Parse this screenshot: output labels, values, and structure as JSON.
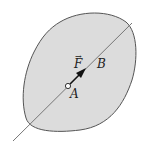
{
  "diagram": {
    "type": "rigid-body-force",
    "body": {
      "fill": "#dcdcdc",
      "stroke": "#555555"
    },
    "line_of_action": {
      "color": "#777777"
    },
    "labels": {
      "force": "F",
      "force_vector_mark": "→",
      "point_a": "A",
      "point_b": "B"
    },
    "arrow_color": "#111111"
  }
}
